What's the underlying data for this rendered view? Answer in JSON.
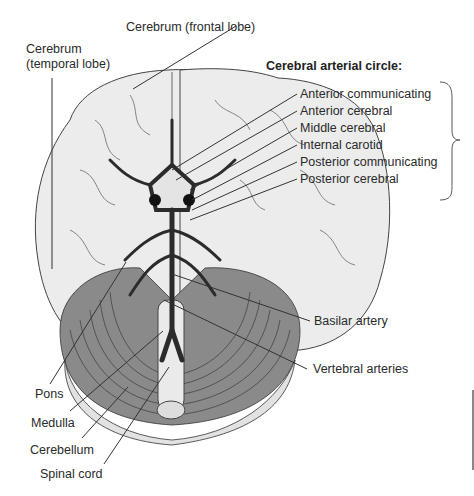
{
  "diagram": {
    "heading": "Cerebral arterial circle:",
    "circle_labels": [
      "Anterior communicating",
      "Anterior cerebral",
      "Middle cerebral",
      "Internal carotid",
      "Posterior communicating",
      "Posterior cerebral"
    ],
    "labels": {
      "frontal_lobe": "Cerebrum (frontal lobe)",
      "temporal_lobe_1": "Cerebrum",
      "temporal_lobe_2": "(temporal lobe)",
      "basilar": "Basilar artery",
      "vertebral": "Vertebral arteries",
      "pons": "Pons",
      "medulla": "Medulla",
      "cerebellum": "Cerebellum",
      "spinal_cord": "Spinal cord"
    },
    "colors": {
      "cerebrum_fill": "#ececec",
      "cerebellum_fill": "#8a8a8a",
      "artery_fill": "#2b2b2b",
      "line": "#333333"
    }
  }
}
